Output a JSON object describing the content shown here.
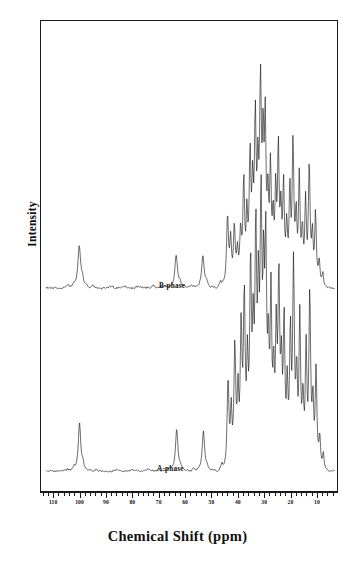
{
  "figure": {
    "y_axis_title": "Intensity",
    "x_axis_title": "Chemical Shift (ppm)"
  },
  "axis": {
    "tick_labels": [
      "110",
      "100",
      "90",
      "80",
      "70",
      "60",
      "50",
      "40",
      "30",
      "20",
      "10"
    ]
  },
  "traces": {
    "upper_label": "B-phase",
    "lower_label": "A-phase"
  },
  "chart_data": {
    "type": "line",
    "title": "",
    "xlabel": "Chemical Shift (ppm)",
    "ylabel": "Intensity",
    "xlim": [
      115,
      2
    ],
    "x_axis_reversed": true,
    "grid": false,
    "legend": "inline-annotations",
    "tick_values": [
      110,
      100,
      90,
      80,
      70,
      60,
      50,
      40,
      30,
      20,
      10
    ],
    "minor_tick_step": 2,
    "annotations": [
      {
        "text": "B-phase",
        "x": 78,
        "trace": "B-phase"
      },
      {
        "text": "A-phase",
        "x": 79,
        "trace": "A-phase"
      }
    ],
    "series": [
      {
        "name": "B-phase",
        "baseline_ppm_range": [
          113,
          3
        ],
        "noise_amplitude": 0.035,
        "peaks": [
          {
            "ppm": 105.0,
            "height": 0.06,
            "width": 0.7
          },
          {
            "ppm": 102.6,
            "height": 0.05,
            "width": 0.6
          },
          {
            "ppm": 100.4,
            "height": 0.9,
            "width": 0.85
          },
          {
            "ppm": 99.2,
            "height": 0.16,
            "width": 0.7
          },
          {
            "ppm": 95.0,
            "height": 0.05,
            "width": 0.6
          },
          {
            "ppm": 88.0,
            "height": 0.04,
            "width": 0.6
          },
          {
            "ppm": 83.0,
            "height": 0.05,
            "width": 0.6
          },
          {
            "ppm": 78.0,
            "height": 0.04,
            "width": 0.6
          },
          {
            "ppm": 72.0,
            "height": 0.05,
            "width": 0.6
          },
          {
            "ppm": 68.0,
            "height": 0.05,
            "width": 0.6
          },
          {
            "ppm": 63.4,
            "height": 0.72,
            "width": 0.8
          },
          {
            "ppm": 62.0,
            "height": 0.1,
            "width": 0.6
          },
          {
            "ppm": 57.5,
            "height": 0.05,
            "width": 0.6
          },
          {
            "ppm": 53.2,
            "height": 0.7,
            "width": 0.8
          },
          {
            "ppm": 51.8,
            "height": 0.09,
            "width": 0.6
          },
          {
            "ppm": 46.5,
            "height": 0.12,
            "width": 0.6
          },
          {
            "ppm": 43.8,
            "height": 1.5,
            "width": 0.6
          },
          {
            "ppm": 42.6,
            "height": 0.95,
            "width": 0.55
          },
          {
            "ppm": 41.2,
            "height": 1.25,
            "width": 0.55
          },
          {
            "ppm": 40.0,
            "height": 0.7,
            "width": 0.55
          },
          {
            "ppm": 38.8,
            "height": 1.1,
            "width": 0.55
          },
          {
            "ppm": 37.6,
            "height": 2.2,
            "width": 0.55
          },
          {
            "ppm": 36.4,
            "height": 1.35,
            "width": 0.5
          },
          {
            "ppm": 35.2,
            "height": 2.7,
            "width": 0.55
          },
          {
            "ppm": 34.2,
            "height": 1.8,
            "width": 0.5
          },
          {
            "ppm": 33.2,
            "height": 3.4,
            "width": 0.55
          },
          {
            "ppm": 32.2,
            "height": 2.0,
            "width": 0.5
          },
          {
            "ppm": 31.2,
            "height": 4.1,
            "width": 0.6
          },
          {
            "ppm": 30.2,
            "height": 2.6,
            "width": 0.5
          },
          {
            "ppm": 29.4,
            "height": 3.2,
            "width": 0.5
          },
          {
            "ppm": 28.4,
            "height": 1.7,
            "width": 0.5
          },
          {
            "ppm": 27.4,
            "height": 2.4,
            "width": 0.5
          },
          {
            "ppm": 26.4,
            "height": 1.3,
            "width": 0.5
          },
          {
            "ppm": 25.4,
            "height": 1.9,
            "width": 0.5
          },
          {
            "ppm": 24.4,
            "height": 2.9,
            "width": 0.5
          },
          {
            "ppm": 23.4,
            "height": 1.45,
            "width": 0.5
          },
          {
            "ppm": 22.4,
            "height": 2.1,
            "width": 0.5
          },
          {
            "ppm": 21.2,
            "height": 1.2,
            "width": 0.5
          },
          {
            "ppm": 20.0,
            "height": 1.95,
            "width": 0.5
          },
          {
            "ppm": 18.8,
            "height": 3.0,
            "width": 0.55
          },
          {
            "ppm": 17.6,
            "height": 1.4,
            "width": 0.5
          },
          {
            "ppm": 16.4,
            "height": 2.3,
            "width": 0.5
          },
          {
            "ppm": 15.2,
            "height": 1.1,
            "width": 0.5
          },
          {
            "ppm": 14.0,
            "height": 1.75,
            "width": 0.5
          },
          {
            "ppm": 12.6,
            "height": 2.55,
            "width": 0.55
          },
          {
            "ppm": 11.4,
            "height": 1.0,
            "width": 0.5
          },
          {
            "ppm": 10.2,
            "height": 1.55,
            "width": 0.5
          },
          {
            "ppm": 8.8,
            "height": 0.55,
            "width": 0.5
          },
          {
            "ppm": 7.4,
            "height": 0.3,
            "width": 0.5
          }
        ]
      },
      {
        "name": "A-phase",
        "baseline_ppm_range": [
          113,
          3
        ],
        "noise_amplitude": 0.03,
        "peaks": [
          {
            "ppm": 105.0,
            "height": 0.05,
            "width": 0.6
          },
          {
            "ppm": 102.4,
            "height": 0.06,
            "width": 0.6
          },
          {
            "ppm": 100.3,
            "height": 1.05,
            "width": 0.75
          },
          {
            "ppm": 99.0,
            "height": 0.14,
            "width": 0.6
          },
          {
            "ppm": 94.0,
            "height": 0.05,
            "width": 0.6
          },
          {
            "ppm": 86.0,
            "height": 0.05,
            "width": 0.6
          },
          {
            "ppm": 80.0,
            "height": 0.04,
            "width": 0.6
          },
          {
            "ppm": 74.0,
            "height": 0.05,
            "width": 0.6
          },
          {
            "ppm": 70.0,
            "height": 0.05,
            "width": 0.6
          },
          {
            "ppm": 66.0,
            "height": 0.05,
            "width": 0.6
          },
          {
            "ppm": 63.2,
            "height": 0.92,
            "width": 0.75
          },
          {
            "ppm": 61.8,
            "height": 0.09,
            "width": 0.6
          },
          {
            "ppm": 57.0,
            "height": 0.05,
            "width": 0.6
          },
          {
            "ppm": 53.0,
            "height": 0.88,
            "width": 0.75
          },
          {
            "ppm": 51.6,
            "height": 0.08,
            "width": 0.6
          },
          {
            "ppm": 46.0,
            "height": 0.14,
            "width": 0.6
          },
          {
            "ppm": 43.6,
            "height": 1.95,
            "width": 0.55
          },
          {
            "ppm": 42.4,
            "height": 1.2,
            "width": 0.5
          },
          {
            "ppm": 41.0,
            "height": 2.6,
            "width": 0.55
          },
          {
            "ppm": 39.8,
            "height": 1.5,
            "width": 0.5
          },
          {
            "ppm": 38.6,
            "height": 2.9,
            "width": 0.55
          },
          {
            "ppm": 37.4,
            "height": 3.6,
            "width": 0.55
          },
          {
            "ppm": 36.2,
            "height": 2.0,
            "width": 0.5
          },
          {
            "ppm": 35.0,
            "height": 4.2,
            "width": 0.55
          },
          {
            "ppm": 34.0,
            "height": 2.4,
            "width": 0.5
          },
          {
            "ppm": 33.0,
            "height": 4.8,
            "width": 0.55
          },
          {
            "ppm": 32.0,
            "height": 3.0,
            "width": 0.5
          },
          {
            "ppm": 31.0,
            "height": 5.4,
            "width": 0.6
          },
          {
            "ppm": 30.0,
            "height": 3.3,
            "width": 0.5
          },
          {
            "ppm": 29.2,
            "height": 4.4,
            "width": 0.55
          },
          {
            "ppm": 28.2,
            "height": 2.2,
            "width": 0.5
          },
          {
            "ppm": 27.2,
            "height": 3.5,
            "width": 0.5
          },
          {
            "ppm": 26.2,
            "height": 1.8,
            "width": 0.5
          },
          {
            "ppm": 25.2,
            "height": 2.7,
            "width": 0.5
          },
          {
            "ppm": 24.2,
            "height": 4.0,
            "width": 0.55
          },
          {
            "ppm": 23.2,
            "height": 1.9,
            "width": 0.5
          },
          {
            "ppm": 22.2,
            "height": 3.1,
            "width": 0.5
          },
          {
            "ppm": 21.0,
            "height": 1.6,
            "width": 0.5
          },
          {
            "ppm": 19.8,
            "height": 2.8,
            "width": 0.5
          },
          {
            "ppm": 18.6,
            "height": 4.3,
            "width": 0.55
          },
          {
            "ppm": 17.4,
            "height": 1.85,
            "width": 0.5
          },
          {
            "ppm": 16.2,
            "height": 3.2,
            "width": 0.5
          },
          {
            "ppm": 15.0,
            "height": 1.4,
            "width": 0.5
          },
          {
            "ppm": 13.8,
            "height": 2.5,
            "width": 0.5
          },
          {
            "ppm": 12.4,
            "height": 3.7,
            "width": 0.55
          },
          {
            "ppm": 11.2,
            "height": 1.3,
            "width": 0.5
          },
          {
            "ppm": 10.0,
            "height": 2.1,
            "width": 0.5
          },
          {
            "ppm": 8.6,
            "height": 0.7,
            "width": 0.5
          },
          {
            "ppm": 7.2,
            "height": 0.35,
            "width": 0.5
          }
        ]
      }
    ]
  }
}
